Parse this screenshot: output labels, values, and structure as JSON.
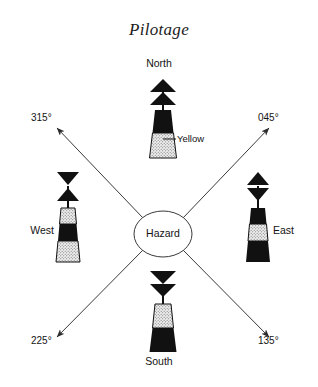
{
  "document": {
    "title": "Pilotage",
    "background_color": "#ffffff",
    "ink_color": "#141414"
  },
  "hazard": {
    "label": "Hazard",
    "cx": 163,
    "cy": 234,
    "rx": 29,
    "ry": 23
  },
  "colors": {
    "black": "#111111",
    "yellow_fill": "#e8e8e8",
    "line": "#3a3a3a"
  },
  "callouts": [
    {
      "id": "yellow-callout",
      "text": "Yellow",
      "x": 176,
      "y": 133
    }
  ],
  "bearings": [
    {
      "id": "bearing-315",
      "label": "315°",
      "x": 30,
      "y": 117,
      "direction": "up-left"
    },
    {
      "id": "bearing-045",
      "label": "045°",
      "x": 258,
      "y": 117,
      "direction": "up-right"
    },
    {
      "id": "bearing-225",
      "label": "225°",
      "x": 30,
      "y": 340,
      "direction": "down-left"
    },
    {
      "id": "bearing-135",
      "label": "135°",
      "x": 258,
      "y": 340,
      "direction": "down-right"
    }
  ],
  "marks": [
    {
      "id": "north",
      "label": "North",
      "label_x": 163,
      "label_y": 64,
      "label_align": "center",
      "topmark": "two-cones-point-up",
      "bands": [
        "black",
        "yellow"
      ]
    },
    {
      "id": "east",
      "label": "East",
      "label_x": 271,
      "label_y": 231,
      "label_align": "left",
      "topmark": "two-cones-base-to-base",
      "bands": [
        "black",
        "yellow",
        "black"
      ]
    },
    {
      "id": "south",
      "label": "South",
      "label_x": 163,
      "label_y": 362,
      "label_align": "center",
      "topmark": "two-cones-point-down",
      "bands": [
        "yellow",
        "black"
      ]
    },
    {
      "id": "west",
      "label": "West",
      "label_x": 52,
      "label_y": 231,
      "label_align": "right",
      "topmark": "two-cones-point-to-point",
      "bands": [
        "yellow",
        "black",
        "yellow"
      ]
    }
  ]
}
